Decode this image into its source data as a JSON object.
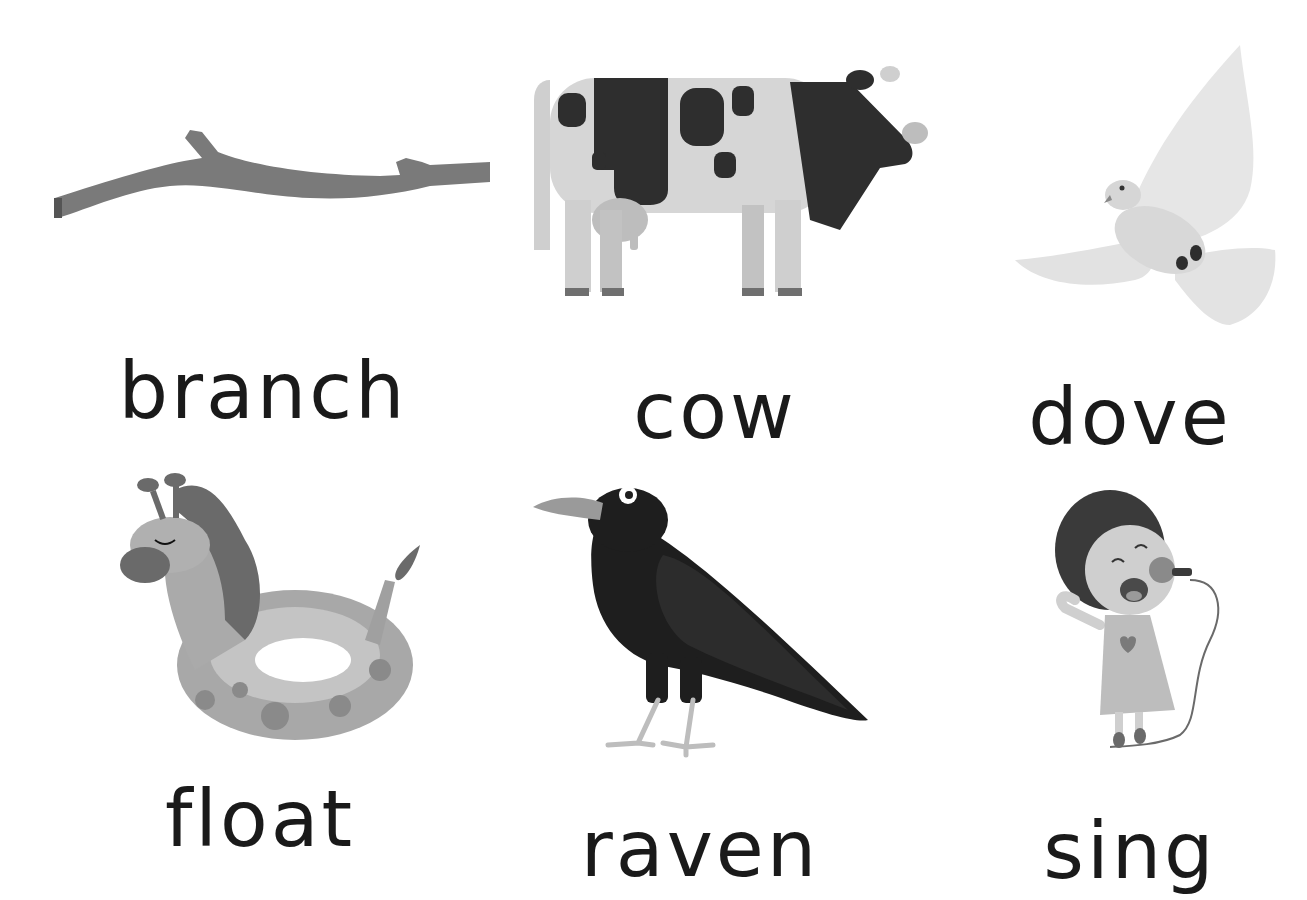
{
  "worksheet": {
    "cards": [
      {
        "word": "branch",
        "icon": "branch-icon"
      },
      {
        "word": "cow",
        "icon": "cow-icon"
      },
      {
        "word": "dove",
        "icon": "dove-icon"
      },
      {
        "word": "float",
        "icon": "giraffe-float-icon"
      },
      {
        "word": "raven",
        "icon": "raven-icon"
      },
      {
        "word": "sing",
        "icon": "girl-singing-icon"
      }
    ],
    "colors": {
      "background": "#ffffff",
      "text": "#1a1a1a",
      "branch": "#7a7a7a",
      "cow_body": "#d6d6d6",
      "cow_spots": "#2e2e2e",
      "dove": "#e3e3e3",
      "raven": "#1e1e1e",
      "float": "#a8a8a8"
    }
  }
}
